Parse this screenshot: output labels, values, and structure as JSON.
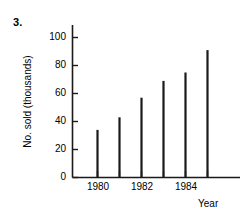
{
  "problem": {
    "number": "3."
  },
  "chart_data": {
    "type": "bar",
    "title": "",
    "subtitle": "",
    "xlabel": "Year",
    "ylabel": "No. sold (thousands)",
    "categories": [
      "1980",
      "1981",
      "1982",
      "1983",
      "1984",
      "1985"
    ],
    "values": [
      34,
      43,
      57,
      69,
      75,
      91
    ],
    "x_tick_labels": [
      "1980",
      "1982",
      "1984"
    ],
    "x_tick_positions": [
      1980,
      1982,
      1984
    ],
    "y_tick_labels": [
      "0",
      "20",
      "40",
      "60",
      "80",
      "100"
    ],
    "y_ticks": [
      0,
      20,
      40,
      60,
      80,
      100
    ],
    "ylim": [
      0,
      107
    ],
    "xlim": [
      1979.3,
      1985.8
    ],
    "grid": false,
    "legend": false,
    "legend_position": "none",
    "series": [
      {
        "name": "No. sold (thousands)",
        "values": [
          34,
          43,
          57,
          69,
          75,
          91
        ]
      }
    ],
    "bar_style": "thin-vertical-line",
    "line_color": "#1a1a1a",
    "axis_color": "#1a1a1a",
    "background": "#ffffff",
    "annotations": []
  }
}
